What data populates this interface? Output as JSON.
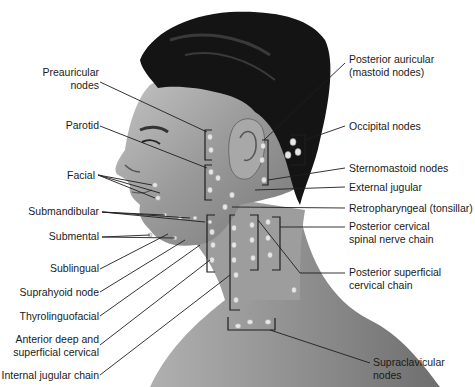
{
  "figure": {
    "labels_left": [
      {
        "id": "preauricular",
        "text": "Preauricular",
        "text2": "nodes"
      },
      {
        "id": "parotid",
        "text": "Parotid"
      },
      {
        "id": "facial",
        "text": "Facial"
      },
      {
        "id": "submandibular",
        "text": "Submandibular"
      },
      {
        "id": "submental",
        "text": "Submental"
      },
      {
        "id": "sublingual",
        "text": "Sublingual"
      },
      {
        "id": "suprahyoid",
        "text": "Suprahyoid node"
      },
      {
        "id": "thyrolinguofacial",
        "text": "Thyrolinguofacial"
      },
      {
        "id": "anterior-deep",
        "text": "Anterior deep and",
        "text2": "superficial cervical"
      },
      {
        "id": "internal-jugular",
        "text": "Internal jugular chain"
      }
    ],
    "labels_right": [
      {
        "id": "posterior-auricular",
        "text": "Posterior auricular",
        "text2": "(mastoid nodes)"
      },
      {
        "id": "occipital",
        "text": "Occipital nodes"
      },
      {
        "id": "sternomastoid",
        "text": "Sternomastoid nodes"
      },
      {
        "id": "external-jugular",
        "text": "External jugular"
      },
      {
        "id": "retropharyngeal",
        "text": "Retropharyngeal (tonsillar)"
      },
      {
        "id": "posterior-cervical",
        "text": "Posterior cervical",
        "text2": "spinal nerve chain"
      },
      {
        "id": "posterior-superficial",
        "text": "Posterior superficial",
        "text2": "cervical chain"
      },
      {
        "id": "supraclavicular",
        "text": "Supraclavicular",
        "text2": "nodes"
      }
    ]
  },
  "colors": {
    "hair": "#141414",
    "skin_light": "#b9b9b9",
    "skin_mid": "#8f8f8f",
    "skin_dark": "#5a5a5a",
    "leader_line": "#1e1e1e",
    "node": "#e8e8e8"
  }
}
